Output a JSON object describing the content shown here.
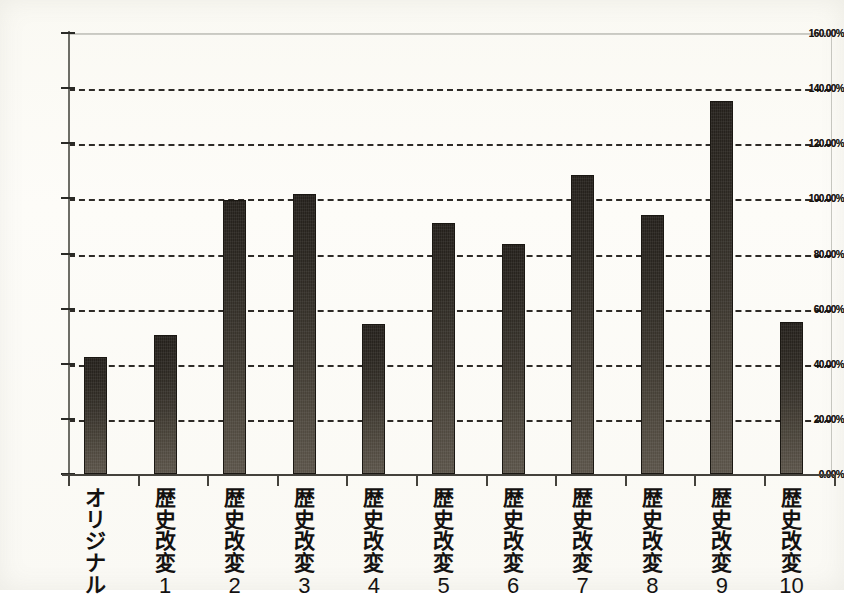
{
  "chart_data": {
    "type": "bar",
    "title": "",
    "subtitle": "",
    "xlabel": "",
    "ylabel": "",
    "ylim": [
      0,
      160
    ],
    "y_tick_step": 20,
    "y_tick_labels": [
      "0.00%",
      "20.00%",
      "40.00%",
      "60.00%",
      "80.00%",
      "100.00%",
      "120.00%",
      "140.00%",
      "160.00%"
    ],
    "y_tick_values": [
      0,
      20,
      40,
      60,
      80,
      100,
      120,
      140,
      160
    ],
    "grid": "horizontal-dashed",
    "legend": "none",
    "value_unit": "%",
    "categories": [
      "オリジナル",
      "歴史改変 1",
      "歴史改変 2",
      "歴史改変 3",
      "歴史改変 4",
      "歴史改変 5",
      "歴史改変 6",
      "歴史改変 7",
      "歴史改変 8",
      "歴史改変 9",
      "歴史改変 10"
    ],
    "values": [
      42.5,
      50.5,
      99.5,
      101.5,
      54.5,
      91.0,
      83.5,
      108.5,
      94.0,
      135.5,
      55.0
    ],
    "bar_color": "#2b2721",
    "bar_color_bottom": "#5a5349",
    "background_color": "#fbfbf7",
    "axis_color": "#44423c",
    "gridline_color": "#1d1a16"
  },
  "categories_vertical": [
    {
      "chars": [
        "オ",
        "リ",
        "ジ",
        "ナ",
        "ル"
      ],
      "num": ""
    },
    {
      "chars": [
        "歴",
        "史",
        "改",
        "変"
      ],
      "num": "1"
    },
    {
      "chars": [
        "歴",
        "史",
        "改",
        "変"
      ],
      "num": "2"
    },
    {
      "chars": [
        "歴",
        "史",
        "改",
        "変"
      ],
      "num": "3"
    },
    {
      "chars": [
        "歴",
        "史",
        "改",
        "変"
      ],
      "num": "4"
    },
    {
      "chars": [
        "歴",
        "史",
        "改",
        "変"
      ],
      "num": "5"
    },
    {
      "chars": [
        "歴",
        "史",
        "改",
        "変"
      ],
      "num": "6"
    },
    {
      "chars": [
        "歴",
        "史",
        "改",
        "変"
      ],
      "num": "7"
    },
    {
      "chars": [
        "歴",
        "史",
        "改",
        "変"
      ],
      "num": "8"
    },
    {
      "chars": [
        "歴",
        "史",
        "改",
        "変"
      ],
      "num": "9"
    },
    {
      "chars": [
        "歴",
        "史",
        "改",
        "変"
      ],
      "num": "10"
    }
  ]
}
